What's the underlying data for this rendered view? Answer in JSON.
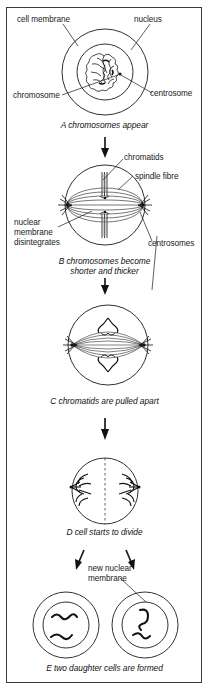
{
  "figure": {
    "border_color": "#3a3a3a",
    "ink_color": "#1a1a1a",
    "background": "#ffffff"
  },
  "stages": [
    {
      "id": "A",
      "caption": "A chromosomes appear",
      "labels": [
        {
          "name": "cell-membrane",
          "text": "cell membrane"
        },
        {
          "name": "nucleus",
          "text": "nucleus"
        },
        {
          "name": "chromosome",
          "text": "chromosome"
        },
        {
          "name": "centrosome",
          "text": "centrosome"
        }
      ]
    },
    {
      "id": "B",
      "caption_line1": "B chromosomes become",
      "caption_line2": "shorter and thicker",
      "labels": [
        {
          "name": "chromatids",
          "text": "chromatids"
        },
        {
          "name": "spindle-fibre",
          "text": "spindle fibre"
        },
        {
          "name": "nuclear-membrane-disintegrates-line1",
          "text": "nuclear"
        },
        {
          "name": "nuclear-membrane-disintegrates-line2",
          "text": "membrane"
        },
        {
          "name": "nuclear-membrane-disintegrates-line3",
          "text": "disintegrates"
        },
        {
          "name": "centrosomes",
          "text": "centrosomes"
        }
      ]
    },
    {
      "id": "C",
      "caption": "C chromatids are pulled apart",
      "labels": []
    },
    {
      "id": "D",
      "caption": "D cell starts to divide",
      "labels": []
    },
    {
      "id": "E",
      "caption": "E two daughter cells are formed",
      "labels": [
        {
          "name": "new-nuclear-membrane-line1",
          "text": "new nuclear"
        },
        {
          "name": "new-nuclear-membrane-line2",
          "text": "membrane"
        }
      ]
    }
  ],
  "text": {
    "cell_membrane": "cell membrane",
    "nucleus": "nucleus",
    "chromosome": "chromosome",
    "centrosome": "centrosome",
    "caption_a": "A chromosomes appear",
    "chromatids": "chromatids",
    "spindle_fibre": "spindle fibre",
    "nuclear_1": "nuclear",
    "nuclear_2": "membrane",
    "nuclear_3": "disintegrates",
    "centrosomes": "centrosomes",
    "caption_b1": "B chromosomes become",
    "caption_b2": "shorter and thicker",
    "caption_c": "C chromatids are pulled apart",
    "caption_d": "D cell starts to divide",
    "new_nuclear_1": "new nuclear",
    "new_nuclear_2": "membrane",
    "caption_e": "E two daughter cells are formed"
  }
}
